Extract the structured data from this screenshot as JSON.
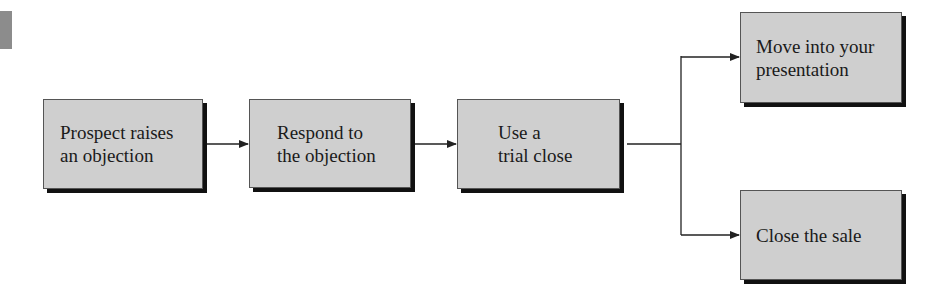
{
  "diagram": {
    "type": "flowchart",
    "nodes": [
      {
        "id": "prospect",
        "label": "Prospect raises\nan objection"
      },
      {
        "id": "respond",
        "label": "Respond to\nthe objection"
      },
      {
        "id": "trial",
        "label": "Use a\ntrial close"
      },
      {
        "id": "move",
        "label": "Move into your\npresentation"
      },
      {
        "id": "close",
        "label": "Close the sale"
      }
    ],
    "edges": [
      {
        "from": "prospect",
        "to": "respond"
      },
      {
        "from": "respond",
        "to": "trial"
      },
      {
        "from": "trial",
        "to": "move"
      },
      {
        "from": "trial",
        "to": "close"
      }
    ],
    "colors": {
      "box_fill": "#cfcfcf",
      "shadow": "#111111",
      "line": "#222222"
    }
  }
}
